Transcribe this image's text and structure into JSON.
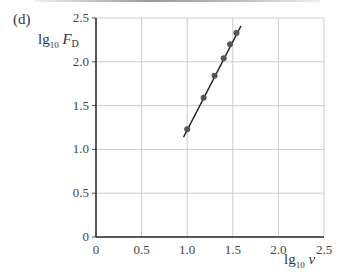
{
  "panel_label": "(d)",
  "y_axis_label": {
    "main": "lg",
    "sub": "10",
    "var": "F",
    "var_sub": "D"
  },
  "x_axis_label": {
    "main": "lg",
    "sub": "10",
    "var": "v"
  },
  "chart_data": {
    "type": "scatter",
    "title": "",
    "xlabel": "lg10 v",
    "ylabel": "lg10 F_D",
    "xlim": [
      0,
      2.5
    ],
    "ylim": [
      0,
      2.5
    ],
    "x_ticks": [
      "0",
      "0.5",
      "1.0",
      "1.5",
      "2.0",
      "2.5"
    ],
    "y_ticks": [
      "0",
      "0.5",
      "1.0",
      "1.5",
      "2.0",
      "2.5"
    ],
    "grid": true,
    "series": [
      {
        "name": "data",
        "x": [
          1.0,
          1.18,
          1.3,
          1.4,
          1.47,
          1.54
        ],
        "y": [
          1.23,
          1.59,
          1.84,
          2.04,
          2.2,
          2.33
        ]
      }
    ],
    "fit_line": {
      "x": [
        0.96,
        1.59
      ],
      "y": [
        1.14,
        2.41
      ]
    },
    "colors": {
      "points": "#555555",
      "line": "#222222",
      "grid": "#cccccc",
      "axis": "#222222"
    }
  }
}
